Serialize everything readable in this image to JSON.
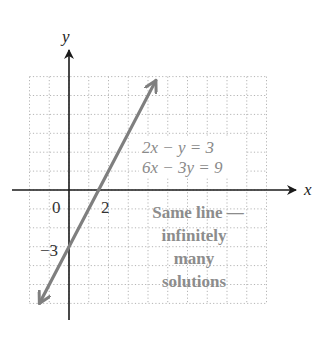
{
  "chart_data": {
    "type": "line",
    "title": "",
    "xlabel": "x",
    "ylabel": "y",
    "xlim": [
      -2,
      10
    ],
    "ylim": [
      -6,
      6
    ],
    "grid": true,
    "grid_style": "dotted",
    "tick_labels": {
      "origin": "0",
      "x": [
        {
          "value": 2,
          "label": "2"
        }
      ],
      "y": [
        {
          "value": -3,
          "label": "−3"
        }
      ]
    },
    "series": [
      {
        "name": "2x − y = 3 / 6x − 3y = 9",
        "equation": "y = 2x - 3",
        "slope": 2,
        "intercept": -3,
        "x": [
          -1.5,
          4.4
        ],
        "y": [
          -6,
          5.8
        ],
        "color": "#7f7f7f",
        "arrows": "both"
      }
    ],
    "annotations": {
      "equations": [
        "2x − y = 3",
        "6x − 3y = 9"
      ],
      "note_lines": [
        "Same line —",
        "infinitely",
        "many",
        "solutions"
      ]
    }
  },
  "labels": {
    "x_axis": "x",
    "y_axis": "y",
    "origin": "0",
    "x_tick": "2",
    "y_tick": "−3",
    "eq1": "2x − y = 3",
    "eq2": "6x − 3y = 9",
    "note1": "Same line —",
    "note2": "infinitely",
    "note3": "many",
    "note4": "solutions"
  },
  "colors": {
    "line": "#7f7f7f",
    "axis": "#1a1a1a",
    "grid": "#b5b5b5",
    "text_gray": "#8a8a8a"
  }
}
